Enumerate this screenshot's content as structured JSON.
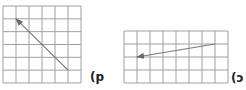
{
  "figures": [
    {
      "id": "left",
      "label": "(p",
      "grid": {
        "x": 3,
        "y": 6,
        "cols": 6,
        "rows": 6,
        "cell_w": 13,
        "cell_h": 12.83
      },
      "vector": {
        "from": [
          5,
          5
        ],
        "to": [
          1,
          1
        ]
      },
      "label_pos": [
        90,
        71
      ]
    },
    {
      "id": "right",
      "label": "(ɔ",
      "grid": {
        "x": 124,
        "y": 31,
        "cols": 8,
        "rows": 4,
        "cell_w": 13,
        "cell_h": 13
      },
      "vector": {
        "from": [
          7,
          1
        ],
        "to": [
          1,
          2
        ]
      },
      "label_pos": [
        231,
        72
      ]
    }
  ],
  "colors": {
    "grid": "#a0a0a0",
    "arrow": "#7a7a7a",
    "label": "#222222"
  }
}
